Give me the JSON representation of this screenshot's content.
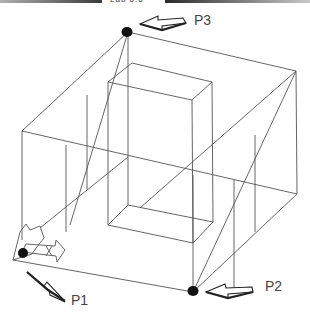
{
  "header": {
    "title": "Lab 6.6"
  },
  "diagram": {
    "type": "3d-wireframe-box-with-inner-block",
    "points": [
      {
        "id": "P1",
        "label": "P1"
      },
      {
        "id": "P2",
        "label": "P2"
      },
      {
        "id": "P3",
        "label": "P3"
      }
    ],
    "colors": {
      "line": "#555555",
      "point": "#111111",
      "label": "#444444"
    }
  }
}
